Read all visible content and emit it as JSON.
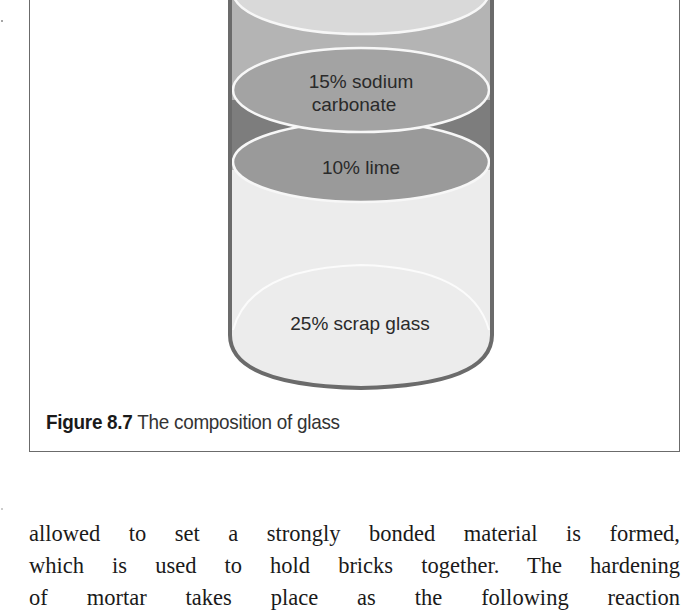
{
  "figure": {
    "number": "Figure 8.7",
    "title": "The composition of glass",
    "layers": [
      {
        "label_line1": "",
        "label_line2": "",
        "color": "#d9d9d9"
      },
      {
        "label_line1": "15% sodium",
        "label_line2": "carbonate",
        "color": "#a3a3a3"
      },
      {
        "label_line1": "10% lime",
        "label_line2": "",
        "color": "#9a9a9a"
      },
      {
        "label_line1": "25% scrap glass",
        "label_line2": "",
        "color": "#ececec"
      }
    ],
    "colors": {
      "outline": "#6b6b6b",
      "top_band": "#b4b4b4",
      "dark_band": "#7d7d7d",
      "ellipse_stroke": "#f7f7f7"
    }
  },
  "body": {
    "lines": [
      "allowed to set a strongly bonded material is formed,",
      "which is used to hold bricks together. The hardening",
      "of mortar takes place as the following reaction"
    ]
  }
}
